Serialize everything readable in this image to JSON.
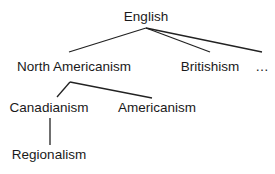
{
  "diagram": {
    "type": "tree",
    "nodes": [
      {
        "id": "english",
        "label": "English"
      },
      {
        "id": "north_americanism",
        "label": "North Americanism",
        "parent": "english"
      },
      {
        "id": "britishism",
        "label": "Britishism",
        "parent": "english"
      },
      {
        "id": "ellipsis",
        "label": "…",
        "parent": "english"
      },
      {
        "id": "canadianism",
        "label": "Canadianism",
        "parent": "north_americanism"
      },
      {
        "id": "americanism",
        "label": "Americanism",
        "parent": "north_americanism"
      },
      {
        "id": "regionalism",
        "label": "Regionalism",
        "parent": "canadianism"
      }
    ],
    "edge_color": "#222222"
  }
}
